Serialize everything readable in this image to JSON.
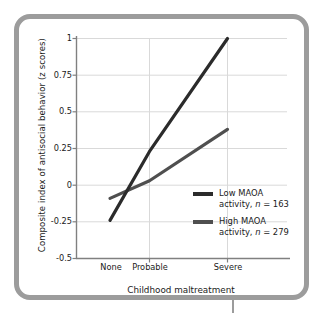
{
  "figure": {
    "frame_color": "#9c9c9c",
    "background": "#ffffff"
  },
  "chart_data": {
    "type": "line",
    "title": "",
    "xlabel": "Childhood maltreatment",
    "ylabel": "Composite index of antisocial behavior (z scores)",
    "categories": [
      "None",
      "Probable",
      "Severe"
    ],
    "x": [
      0,
      1,
      2
    ],
    "xlim": [
      -0.45,
      2.15
    ],
    "ylim": [
      -0.5,
      1.0
    ],
    "yticks": [
      1,
      0.75,
      0.5,
      0.25,
      0,
      -0.25,
      -0.5
    ],
    "ytick_labels": [
      "1",
      "0.75",
      "0.5",
      "0.25",
      "0",
      "-0.25",
      "-0.5"
    ],
    "xtick_labels": [
      "None",
      "Probable",
      "Severe"
    ],
    "grid": true,
    "grid_color": "#d9d9d9",
    "axis_color": "#808080",
    "legend_position": "lower right",
    "series": [
      {
        "name": "Low MAOA activity, n = 163",
        "label_line1": "Low MAOA",
        "label_line2_pre": "activity, ",
        "label_line2_ital": "n",
        "label_line2_post": " = 163",
        "n": 163,
        "color": "#2b2b2b",
        "values": [
          -0.24,
          0.23,
          1.0
        ]
      },
      {
        "name": "High MAOA activity, n = 279",
        "label_line1": "High MAOA",
        "label_line2_pre": "activity, ",
        "label_line2_ital": "n",
        "label_line2_post": " = 279",
        "n": 279,
        "color": "#4f4f4f",
        "values": [
          -0.09,
          0.03,
          0.38
        ]
      }
    ]
  }
}
